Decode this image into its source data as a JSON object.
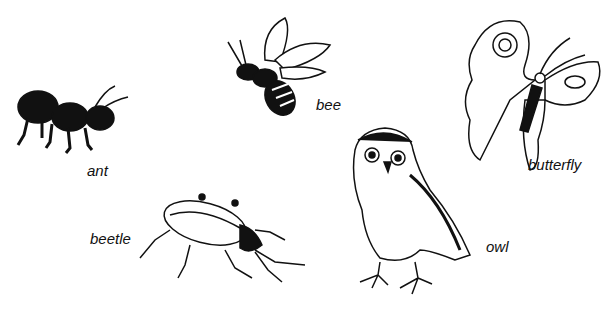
{
  "labels": {
    "ant": "ant",
    "bee": "bee",
    "butterfly": "butterfly",
    "beetle": "beetle",
    "owl": "owl"
  },
  "colors": {
    "ink": "#111111",
    "paper": "#ffffff"
  }
}
